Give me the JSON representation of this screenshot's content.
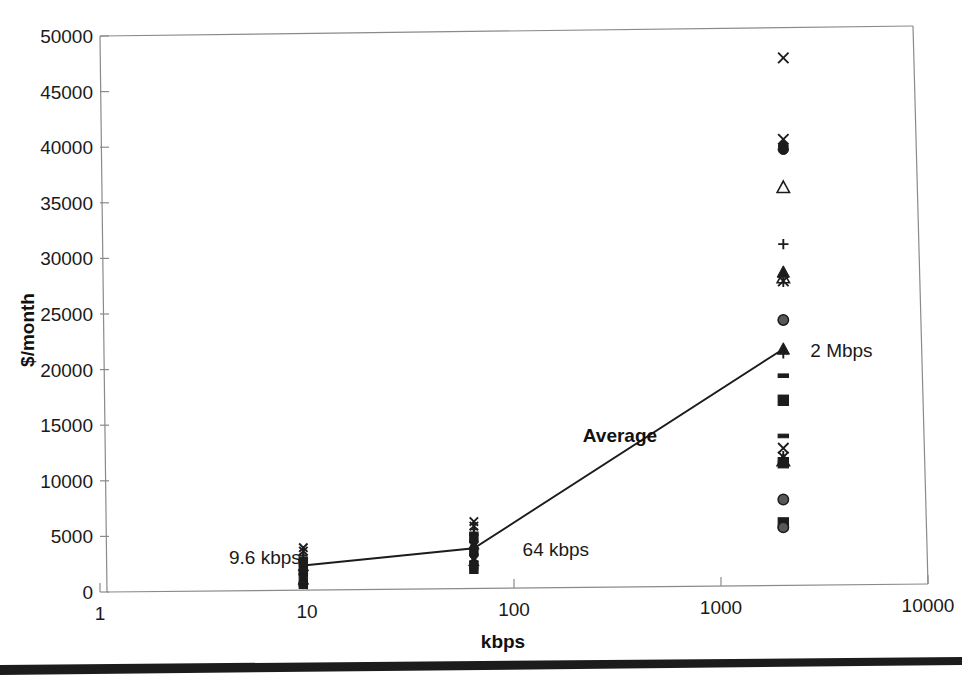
{
  "chart_data": {
    "type": "scatter",
    "title": "",
    "subtitle": "",
    "xlabel": "kbps",
    "ylabel": "$/month",
    "x_scale": "log",
    "y_scale": "linear",
    "xlim": [
      1,
      10000
    ],
    "ylim": [
      0,
      50000
    ],
    "x_ticks": [
      "1",
      "10",
      "100",
      "1000",
      "10000"
    ],
    "x_tick_values": [
      1,
      10,
      100,
      1000,
      10000
    ],
    "y_ticks": [
      "0",
      "5000",
      "10000",
      "15000",
      "20000",
      "25000",
      "30000",
      "35000",
      "40000",
      "45000",
      "50000"
    ],
    "y_tick_values": [
      0,
      5000,
      10000,
      15000,
      20000,
      25000,
      30000,
      35000,
      40000,
      45000,
      50000
    ],
    "grid": false,
    "legend": "none",
    "annotations": [
      {
        "text": "9.6 kbps",
        "x": 4.2,
        "y": 2900,
        "bold": false
      },
      {
        "text": "64 kbps",
        "x": 110,
        "y": 3400,
        "bold": false
      },
      {
        "text": "2 Mbps",
        "x": 2700,
        "y": 21000,
        "bold": false
      },
      {
        "text": "Average",
        "x": 215,
        "y": 13600,
        "bold": true
      }
    ],
    "series": [
      {
        "name": "Average",
        "type": "line",
        "x": [
          9.6,
          64,
          2000
        ],
        "values": [
          2200,
          3600,
          21200
        ]
      },
      {
        "name": "9.6 kbps quotes",
        "type": "scatter",
        "x": 9.6,
        "values": [
          3800,
          3500,
          3100,
          2800,
          2500,
          2300,
          2100,
          1900,
          1700,
          1500,
          1300,
          1100,
          900,
          700,
          500,
          300
        ],
        "markers": [
          "x",
          "star",
          "plus",
          "dash",
          "square",
          "circle",
          "triangle",
          "diamond",
          "square",
          "circle",
          "dash",
          "x",
          "triangle",
          "square",
          "circle",
          "dash"
        ]
      },
      {
        "name": "64 kbps quotes",
        "type": "scatter",
        "x": 64,
        "values": [
          6000,
          5600,
          5300,
          4900,
          4500,
          4200,
          3900,
          3600,
          3300,
          3000,
          2700,
          2400,
          2100,
          1800,
          1500
        ],
        "markers": [
          "x",
          "star",
          "plus",
          "dash",
          "square",
          "circle",
          "triangle",
          "diamond",
          "square",
          "circle",
          "x",
          "triangle",
          "square",
          "circle",
          "dash"
        ]
      },
      {
        "name": "2 Mbps quotes",
        "type": "scatter",
        "x": 2000,
        "values": [
          47300,
          40000,
          39400,
          39100,
          35700,
          30600,
          28100,
          27600,
          27300,
          23800,
          21200,
          20800,
          18800,
          16600,
          13400,
          12300,
          11500,
          11200,
          11000,
          7700,
          5600,
          5200
        ],
        "markers": [
          "x",
          "x",
          "diamond",
          "circle-filled",
          "triangle-open",
          "plus",
          "triangle-filled",
          "triangle-open",
          "star",
          "circle-gray",
          "triangle-filled",
          "plus",
          "dash",
          "square",
          "dash",
          "x",
          "star",
          "triangle-open",
          "square",
          "circle-gray",
          "square",
          "circle-gray"
        ]
      }
    ]
  },
  "figure": {
    "x_axis_title": "kbps",
    "y_axis_title": "$/month",
    "bottom_rule": "solid-black-bar"
  }
}
